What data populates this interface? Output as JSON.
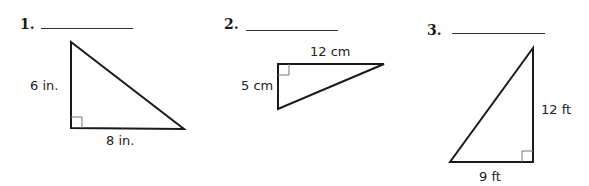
{
  "problems": [
    {
      "number": "1.",
      "answer": "",
      "triangle": {
        "vertices": [
          [
            71,
            42
          ],
          [
            71,
            128
          ],
          [
            184,
            129
          ]
        ],
        "right_angle_at": [
          71,
          128
        ],
        "labels": {
          "vertical_leg": "6 in.",
          "horizontal_leg": "8 in."
        }
      }
    },
    {
      "number": "2.",
      "answer": "",
      "triangle": {
        "vertices": [
          [
            278,
            64
          ],
          [
            384,
            64
          ],
          [
            278,
            109
          ]
        ],
        "right_angle_at": [
          278,
          64
        ],
        "labels": {
          "horizontal_leg": "12 cm",
          "vertical_leg": "5 cm"
        }
      }
    },
    {
      "number": "3.",
      "answer": "",
      "triangle": {
        "vertices": [
          [
            533,
            48
          ],
          [
            533,
            162
          ],
          [
            450,
            162
          ]
        ],
        "right_angle_at": [
          533,
          162
        ],
        "labels": {
          "vertical_leg": "12 ft",
          "horizontal_leg": "9 ft"
        }
      }
    }
  ],
  "colors": {
    "line": "#1a1a1a",
    "right_angle_mark": "#777777"
  }
}
